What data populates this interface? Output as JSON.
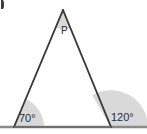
{
  "figure": {
    "type": "geometry-diagram",
    "background_color": "#ffffff",
    "stroke_color": "#3a3a3a",
    "baseline_color": "#8a8a8a",
    "sector_fill_color": "#d9d9d9",
    "label_color": "#2b2b2b",
    "vertices": {
      "apex": {
        "name": "P",
        "x": 63,
        "y": 10
      },
      "base_left": {
        "name": "left-base-vertex",
        "x": 14,
        "y": 127
      },
      "base_right": {
        "name": "right-base-vertex",
        "x": 111,
        "y": 127
      }
    },
    "baseline": {
      "x1": 0,
      "y1": 127,
      "x2": 147,
      "y2": 127
    },
    "angles": [
      {
        "id": "apex",
        "label": "P",
        "position": "apex",
        "sector_radius": 18,
        "shaded": true
      },
      {
        "id": "left-base",
        "label": "70°",
        "position": "bottom-left",
        "sector_radius": 30,
        "shaded": true
      },
      {
        "id": "right-base-exterior",
        "label": "120°",
        "position": "bottom-right",
        "sector_radius": 37,
        "shaded": true
      }
    ],
    "corner_artifact": {
      "name": "clipped-glyph",
      "visible": true
    }
  }
}
